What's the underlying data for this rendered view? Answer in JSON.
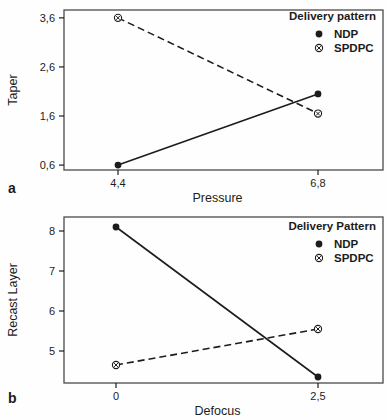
{
  "colors": {
    "ink": "#1c1c1c",
    "frame": "#4a4a4a",
    "background": "#fefefe"
  },
  "chart_data": [
    {
      "id": "a",
      "type": "line",
      "panel_label": "a",
      "title": "",
      "xlabel": "Pressure",
      "ylabel": "Taper",
      "x_values": [
        4.4,
        6.8
      ],
      "x_tick_labels": [
        "4,4",
        "6,8"
      ],
      "y_ticks": [
        0.6,
        1.6,
        2.6,
        3.6
      ],
      "y_tick_labels": [
        "0,6",
        "1,6",
        "2,6",
        "3,6"
      ],
      "ylim": [
        0.5,
        3.76
      ],
      "grid": false,
      "legend": {
        "title": "Delivery pattern",
        "position": "top-right"
      },
      "series": [
        {
          "name": "NDP",
          "marker": "filled-circle",
          "line_style": "solid",
          "values": [
            0.6,
            2.05
          ]
        },
        {
          "name": "SPDPC",
          "marker": "circle-cross",
          "line_style": "dashed",
          "values": [
            3.6,
            1.65
          ]
        }
      ]
    },
    {
      "id": "b",
      "type": "line",
      "panel_label": "b",
      "title": "",
      "xlabel": "Defocus",
      "ylabel": "Recast Layer",
      "x_values": [
        0,
        2.5
      ],
      "x_tick_labels": [
        "0",
        "2,5"
      ],
      "y_ticks": [
        5,
        6,
        7,
        8
      ],
      "y_tick_labels": [
        "5",
        "6",
        "7",
        "8"
      ],
      "ylim": [
        4.2,
        8.35
      ],
      "grid": false,
      "legend": {
        "title": "Delivery Pattern",
        "position": "top-right"
      },
      "series": [
        {
          "name": "NDP",
          "marker": "filled-circle",
          "line_style": "solid",
          "values": [
            8.1,
            4.35
          ]
        },
        {
          "name": "SPDPC",
          "marker": "circle-cross",
          "line_style": "dashed",
          "values": [
            4.65,
            5.55
          ]
        }
      ]
    }
  ]
}
